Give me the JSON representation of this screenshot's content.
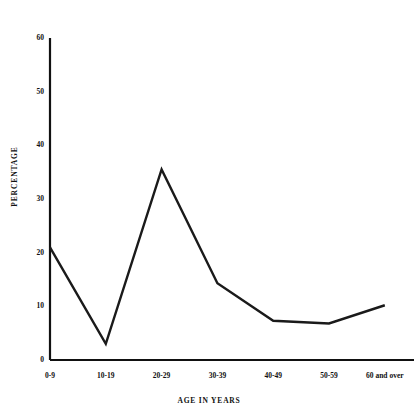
{
  "chart_data": {
    "type": "line",
    "title": "",
    "xlabel": "AGE IN YEARS",
    "ylabel": "PERCENTAGE",
    "categories": [
      "0-9",
      "10-19",
      "20-29",
      "30-39",
      "40-49",
      "50-59",
      "60 and over"
    ],
    "values": [
      21,
      3,
      35.5,
      14.3,
      7.3,
      6.8,
      10.2
    ],
    "series": [
      {
        "name": "Percentage",
        "values": [
          21,
          3,
          35.5,
          14.3,
          7.3,
          6.8,
          10.2
        ]
      }
    ],
    "ylim": [
      0,
      60
    ],
    "yticks": [
      0,
      10,
      20,
      30,
      40,
      50,
      60
    ],
    "ytick_labels": [
      "0",
      "10",
      "20",
      "30",
      "40",
      "50",
      "60"
    ],
    "grid": false,
    "legend": "none",
    "line_color": "#1a1a1a",
    "background_color": "#ffffff"
  },
  "axis": {
    "y_title": "PERCENTAGE",
    "x_title": "AGE IN YEARS",
    "y_ticks": [
      {
        "label": "60",
        "value": 60
      },
      {
        "label": "50",
        "value": 50
      },
      {
        "label": "40",
        "value": 40
      },
      {
        "label": "30",
        "value": 30
      },
      {
        "label": "20",
        "value": 20
      },
      {
        "label": "10",
        "value": 10
      },
      {
        "label": "0",
        "value": 0
      }
    ],
    "x_ticks": [
      {
        "label": "0-9"
      },
      {
        "label": "10-19"
      },
      {
        "label": "20-29"
      },
      {
        "label": "30-39"
      },
      {
        "label": "40-49"
      },
      {
        "label": "50-59"
      },
      {
        "label": "60 and over"
      }
    ]
  }
}
